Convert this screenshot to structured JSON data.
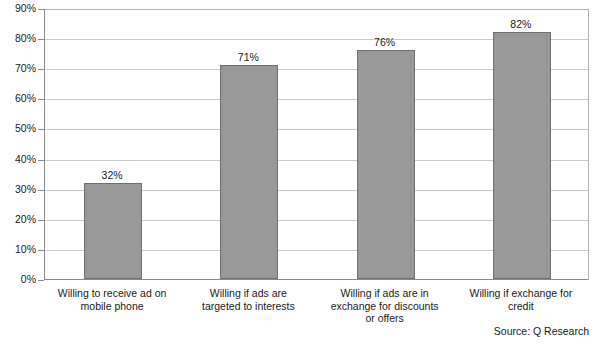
{
  "chart_data": {
    "type": "bar",
    "title": "",
    "subtitle": "",
    "xlabel": "",
    "ylabel": "",
    "ylim": [
      0,
      90
    ],
    "grid": true,
    "legend": false,
    "orientation": "vertical",
    "categories": [
      "Willing to receive ad on mobile phone",
      "Willing if ads are targeted to interests",
      "Willing if ads are in exchange for discounts or offers",
      "Willing if exchange for credit"
    ],
    "category_lines": [
      [
        "Willing to receive ad on",
        "mobile phone"
      ],
      [
        "Willing if ads are",
        "targeted to interests"
      ],
      [
        "Willing if ads are in",
        "exchange for discounts",
        "or offers"
      ],
      [
        "Willing if exchange for",
        "credit"
      ]
    ],
    "values": [
      32,
      71,
      76,
      82
    ],
    "data_labels": [
      "32%",
      "71%",
      "76%",
      "82%"
    ],
    "ytick_values": [
      0,
      10,
      20,
      30,
      40,
      50,
      60,
      70,
      80,
      90
    ],
    "ytick_labels": [
      "0%",
      "10%",
      "20%",
      "30%",
      "40%",
      "50%",
      "60%",
      "70%",
      "80%",
      "90%"
    ],
    "annotations": [
      "Source: Q Research"
    ],
    "colors": {
      "bar_fill": "#989898",
      "bar_border": "#6f6f6f",
      "gridline": "#c9c9c9",
      "axis": "#8a8a8a",
      "text": "#1a1a1a",
      "background": "#ffffff"
    }
  },
  "source_note": "Source: Q Research"
}
